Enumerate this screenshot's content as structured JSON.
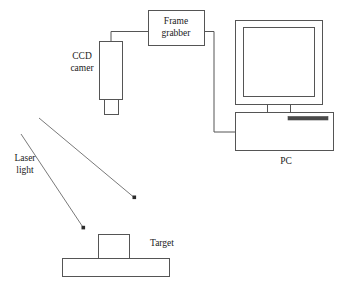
{
  "diagram": {
    "background_color": "#ffffff",
    "line_color": "#555555",
    "ray_color": "#6a6a6a",
    "text_color": "#1a1a1a",
    "drive_bar_color": "#4a4a4a",
    "labels": {
      "frame_grabber_line1": "Frame",
      "frame_grabber_line2": "grabber",
      "ccd_camera_line1": "CCD",
      "ccd_camera_line2": "camer",
      "pc": "PC",
      "laser_light_line1": "Laser",
      "laser_light_line2": "light",
      "target": "Target"
    },
    "components": [
      {
        "name": "frame-grabber-box",
        "shape": "rectangle",
        "x": 148,
        "y": 10,
        "width": 57,
        "height": 36
      },
      {
        "name": "ccd-camera-body",
        "shape": "rectangle",
        "x": 99,
        "y": 41,
        "width": 24,
        "height": 59
      },
      {
        "name": "ccd-camera-lens",
        "shape": "rectangle",
        "x": 104,
        "y": 100,
        "width": 15,
        "height": 15
      },
      {
        "name": "pc-monitor-outer",
        "shape": "rectangle",
        "x": 235,
        "y": 20,
        "width": 88,
        "height": 85
      },
      {
        "name": "pc-monitor-screen",
        "shape": "rectangle",
        "x": 243,
        "y": 27,
        "width": 72,
        "height": 70
      },
      {
        "name": "pc-monitor-neck",
        "shape": "rectangle",
        "x": 267,
        "y": 105,
        "width": 24,
        "height": 8
      },
      {
        "name": "pc-tower",
        "shape": "rectangle",
        "x": 235,
        "y": 113,
        "width": 99,
        "height": 38
      },
      {
        "name": "pc-drive-slot",
        "shape": "bar",
        "x": 288,
        "y": 117,
        "width": 40,
        "height": 3
      },
      {
        "name": "target-block",
        "shape": "rectangle",
        "x": 98,
        "y": 234,
        "width": 32,
        "height": 24
      },
      {
        "name": "target-base",
        "shape": "rectangle",
        "x": 62,
        "y": 258,
        "width": 108,
        "height": 19
      }
    ],
    "cables": [
      {
        "name": "camera-to-frame-grabber-cable",
        "points": "111,41 111,32 148,32"
      },
      {
        "name": "frame-grabber-to-pc-cable",
        "points": "205,32 214,32 214,132 235,132"
      }
    ],
    "rays": [
      {
        "name": "laser-ray-upper",
        "x1": 39,
        "y1": 118,
        "x2": 135,
        "y2": 198
      },
      {
        "name": "laser-ray-lower",
        "x1": 21,
        "y1": 134,
        "x2": 84,
        "y2": 229
      }
    ],
    "label_positions": {
      "frame_grabber": {
        "x": 176,
        "y": 21
      },
      "ccd_camera": {
        "x": 82,
        "y": 56
      },
      "pc": {
        "x": 286,
        "y": 161
      },
      "laser_light": {
        "x": 25,
        "y": 158
      },
      "target": {
        "x": 150,
        "y": 243
      }
    }
  }
}
